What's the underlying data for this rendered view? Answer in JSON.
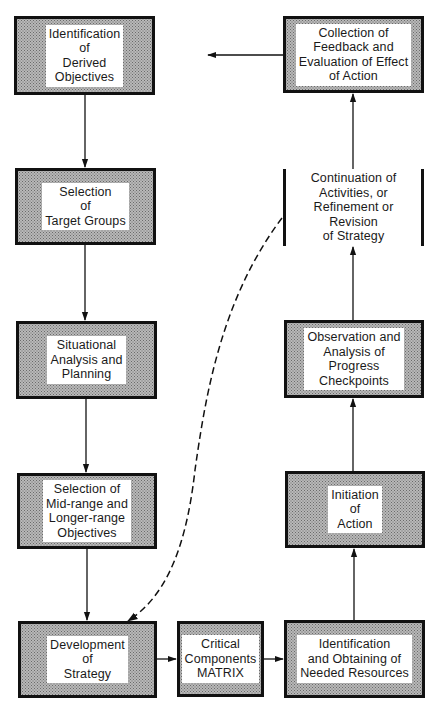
{
  "diagram": {
    "type": "flowchart",
    "nodes": [
      {
        "id": "n1",
        "label": "Identification\nof\nDerived\nObjectives"
      },
      {
        "id": "n2",
        "label": "Selection\nof\nTarget Groups"
      },
      {
        "id": "n3",
        "label": "Situational\nAnalysis and\nPlanning"
      },
      {
        "id": "n4",
        "label": "Selection of\nMid-range and\nLonger-range\nObjectives"
      },
      {
        "id": "n5",
        "label": "Development\nof\nStrategy"
      },
      {
        "id": "n6",
        "label": "Critical\nComponents\nMATRIX"
      },
      {
        "id": "n7",
        "label": "Identification\nand Obtaining of\nNeeded Resources"
      },
      {
        "id": "n8",
        "label": "Initiation\nof\nAction"
      },
      {
        "id": "n9",
        "label": "Observation and\nAnalysis of\nProgress\nCheckpoints"
      },
      {
        "id": "n10",
        "label": "Continuation of\nActivities, or\nRefinement or Revision\nof Strategy"
      },
      {
        "id": "n11",
        "label": "Collection of\nFeedback and\nEvaluation of Effect\nof Action"
      }
    ],
    "edges": [
      {
        "from": "n1",
        "to": "n2",
        "style": "solid"
      },
      {
        "from": "n2",
        "to": "n3",
        "style": "solid"
      },
      {
        "from": "n3",
        "to": "n4",
        "style": "solid"
      },
      {
        "from": "n4",
        "to": "n5",
        "style": "solid"
      },
      {
        "from": "n5",
        "to": "n6",
        "style": "solid"
      },
      {
        "from": "n6",
        "to": "n7",
        "style": "solid"
      },
      {
        "from": "n7",
        "to": "n8",
        "style": "solid"
      },
      {
        "from": "n8",
        "to": "n9",
        "style": "solid"
      },
      {
        "from": "n9",
        "to": "n10",
        "style": "solid"
      },
      {
        "from": "n10",
        "to": "n11",
        "style": "solid"
      },
      {
        "from": "n11",
        "to": "n1",
        "style": "solid"
      },
      {
        "from": "n10",
        "to": "n5",
        "style": "dashed"
      }
    ],
    "colors": {
      "border": "#111111",
      "fill_pattern": "#b8b8b8",
      "label_bg": "#ffffff",
      "line": "#111111"
    }
  }
}
